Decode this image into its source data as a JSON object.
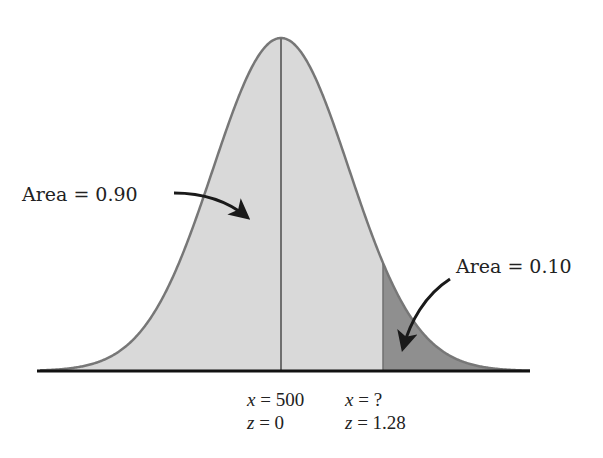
{
  "chart_data": {
    "type": "area",
    "title": "",
    "distribution": "normal",
    "mean_x": 500,
    "regions": [
      {
        "name": "left",
        "area_label": "Area = 0.90",
        "area": 0.9,
        "shade": "light"
      },
      {
        "name": "right-tail",
        "area_label": "Area = 0.10",
        "area": 0.1,
        "shade": "dark"
      }
    ],
    "markers": [
      {
        "x_label": "x = 500",
        "z_label": "z = 0",
        "z": 0
      },
      {
        "x_label": "x = ?",
        "z_label": "z = 1.28",
        "z": 1.28
      }
    ],
    "grid": false,
    "legend": "none"
  },
  "labels": {
    "left_area": "Area = 0.90",
    "right_area": "Area = 0.10",
    "mean_x_var": "x",
    "mean_x_val": " = 500",
    "mean_z_var": "z",
    "mean_z_val": " = 0",
    "cut_x_var": "x",
    "cut_x_val": " = ?",
    "cut_z_var": "z",
    "cut_z_val": " = 1.28"
  },
  "colors": {
    "light_fill": "#d9d9d9",
    "dark_fill": "#8f8f8f",
    "curve_stroke": "#777777",
    "axis": "#111111",
    "arrow": "#1a1a1a"
  }
}
